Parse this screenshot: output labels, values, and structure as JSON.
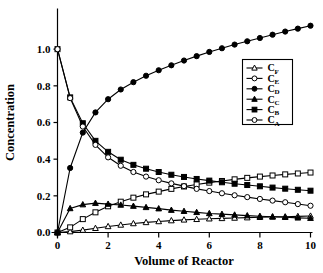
{
  "chart_data": {
    "type": "line",
    "title": "",
    "xlabel": "Volume of Reactor",
    "ylabel": "Concentration",
    "xlim": [
      0,
      10
    ],
    "ylim": [
      0.0,
      1.2
    ],
    "xticks": [
      "0",
      "2",
      "4",
      "6",
      "8",
      "10"
    ],
    "xtick_values": [
      0,
      2,
      4,
      6,
      8,
      10
    ],
    "yticks": [
      "0.0",
      "0.2",
      "0.4",
      "0.6",
      "0.8",
      "1.0"
    ],
    "ytick_values": [
      0.0,
      0.2,
      0.4,
      0.6,
      0.8,
      1.0
    ],
    "grid": false,
    "legend_position": "center-right",
    "x": [
      0,
      0.5,
      1.0,
      1.5,
      2.0,
      2.5,
      3.0,
      3.5,
      4.0,
      4.5,
      5.0,
      5.5,
      6.0,
      6.5,
      7.0,
      7.5,
      8.0,
      8.5,
      9.0,
      9.5,
      10.0
    ],
    "series": [
      {
        "name": "C_F",
        "label": "C",
        "sub": "F",
        "marker": "open-triangle",
        "values": [
          0.0,
          0.005,
          0.013,
          0.023,
          0.033,
          0.041,
          0.049,
          0.055,
          0.06,
          0.065,
          0.069,
          0.072,
          0.075,
          0.077,
          0.079,
          0.081,
          0.083,
          0.085,
          0.086,
          0.088,
          0.09
        ]
      },
      {
        "name": "C_E",
        "label": "C",
        "sub": "E",
        "marker": "open-square",
        "values": [
          0.0,
          0.028,
          0.073,
          0.11,
          0.143,
          0.168,
          0.19,
          0.208,
          0.223,
          0.238,
          0.251,
          0.262,
          0.272,
          0.281,
          0.29,
          0.298,
          0.305,
          0.311,
          0.317,
          0.322,
          0.327
        ]
      },
      {
        "name": "C_D",
        "label": "C",
        "sub": "D",
        "marker": "filled-circle",
        "values": [
          0.0,
          0.352,
          0.545,
          0.655,
          0.727,
          0.78,
          0.82,
          0.855,
          0.885,
          0.912,
          0.938,
          0.962,
          0.985,
          1.005,
          1.025,
          1.043,
          1.061,
          1.079,
          1.096,
          1.112,
          1.128
        ]
      },
      {
        "name": "C_C",
        "label": "C",
        "sub": "C",
        "marker": "filled-triangle",
        "values": [
          0.0,
          0.131,
          0.152,
          0.16,
          0.155,
          0.15,
          0.144,
          0.137,
          0.13,
          0.122,
          0.116,
          0.11,
          0.104,
          0.1,
          0.096,
          0.092,
          0.089,
          0.086,
          0.083,
          0.08,
          0.078
        ]
      },
      {
        "name": "C_B",
        "label": "C",
        "sub": "B",
        "marker": "filled-square",
        "values": [
          1.0,
          0.737,
          0.596,
          0.5,
          0.44,
          0.397,
          0.369,
          0.348,
          0.33,
          0.315,
          0.303,
          0.292,
          0.283,
          0.274,
          0.266,
          0.259,
          0.252,
          0.245,
          0.239,
          0.233,
          0.228
        ]
      },
      {
        "name": "C_A",
        "label": "C",
        "sub": "A",
        "marker": "open-circle",
        "values": [
          1.0,
          0.733,
          0.578,
          0.478,
          0.41,
          0.364,
          0.33,
          0.305,
          0.285,
          0.268,
          0.253,
          0.238,
          0.226,
          0.214,
          0.203,
          0.193,
          0.183,
          0.174,
          0.165,
          0.155,
          0.146
        ]
      }
    ],
    "legend_entries": [
      {
        "label": "C",
        "sub": "F",
        "marker": "open-triangle"
      },
      {
        "label": "C",
        "sub": "E",
        "marker": "open-circle"
      },
      {
        "label": "C",
        "sub": "D",
        "marker": "filled-circle"
      },
      {
        "label": "C",
        "sub": "C",
        "marker": "filled-triangle"
      },
      {
        "label": "C",
        "sub": "B",
        "marker": "filled-square"
      },
      {
        "label": "C",
        "sub": "A",
        "marker": "open-circle"
      }
    ]
  },
  "colors": {
    "ink": "#000000",
    "background": "#ffffff"
  }
}
